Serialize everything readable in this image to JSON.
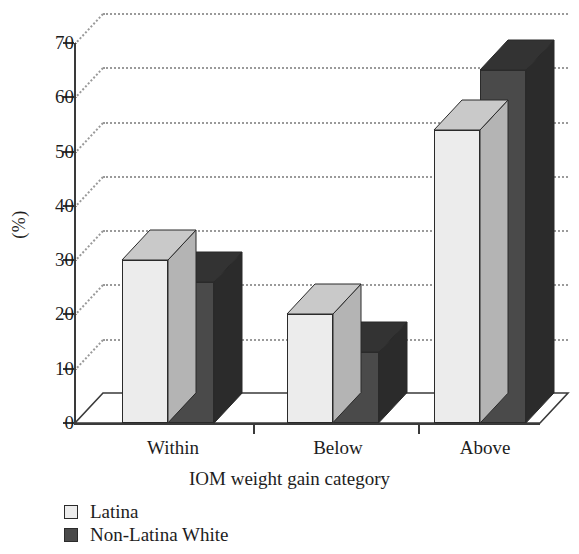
{
  "chart_data": {
    "type": "bar",
    "title": "",
    "subtitle": "",
    "xlabel": "IOM weight gain category",
    "ylabel": "(%)",
    "categories": [
      "Within",
      "Below",
      "Above"
    ],
    "series": [
      {
        "name": "Latina",
        "color": "#ececec",
        "values": [
          30,
          20,
          54
        ]
      },
      {
        "name": "Non-Latina White",
        "color": "#4a4a4a",
        "values": [
          26,
          13,
          65
        ]
      }
    ],
    "ylim": [
      0,
      70
    ],
    "yticks": [
      0,
      10,
      20,
      30,
      40,
      50,
      60,
      70
    ],
    "ytick_labels": [
      "0",
      "10",
      "20",
      "30",
      "40",
      "50",
      "60",
      "70"
    ],
    "grid": "dotted-horizontal-back-wall",
    "legend_position": "bottom-left",
    "style": "3d-grouped-bars"
  },
  "legend": {
    "items": [
      {
        "label": "Latina",
        "swatch": "light-square-swatch"
      },
      {
        "label": "Non-Latina White",
        "swatch": "dark-square-swatch"
      }
    ]
  },
  "axes": {
    "y_title": "(%)",
    "x_title": "IOM weight gain category"
  }
}
